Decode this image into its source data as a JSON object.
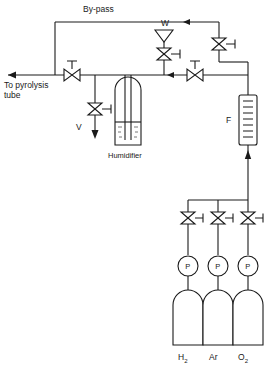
{
  "diagram": {
    "labels": {
      "bypass": "By-pass",
      "outlet": "To pyrolysis",
      "outlet_line2": "tube",
      "vent_w": "W",
      "vent_v": "V",
      "humidifier": "Humidifier",
      "flowmeter": "F"
    },
    "gauges": [
      {
        "name": "gauge-h2",
        "symbol": "P"
      },
      {
        "name": "gauge-ar",
        "symbol": "P"
      },
      {
        "name": "gauge-o2",
        "symbol": "P"
      }
    ],
    "cylinders": [
      {
        "name": "cylinder-hydrogen",
        "label": "H",
        "subscript": "2"
      },
      {
        "name": "cylinder-argon",
        "label": "Ar",
        "subscript": ""
      },
      {
        "name": "cylinder-oxygen",
        "label": "O",
        "subscript": "2"
      }
    ],
    "colors": {
      "line": "#1a1a1a",
      "background": "#ffffff",
      "fill": "#ffffff"
    }
  }
}
